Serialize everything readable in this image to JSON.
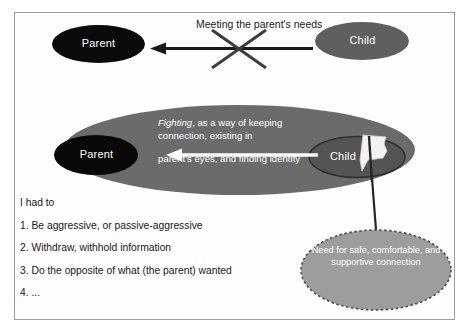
{
  "diagram": {
    "title_visible": false,
    "colors": {
      "frame_border": "#9a9a9a",
      "background": "#ffffff",
      "parent_fill": "#0a0a0a",
      "child_fill": "#5f5f5f",
      "big_ellipse_fill": "#6b6b6b",
      "inner_child_fill": "#545454",
      "dashed_ellipse_fill": "#9d9d9d",
      "dashed_ellipse_border": "#4a4a4a",
      "arrow_dark": "#1a1a1a",
      "arrow_white": "#ffffff",
      "cross_mark": "#3a3a3a",
      "flag_fill": "#f2f2f2",
      "text_dark": "#171717",
      "text_light": "#ffffff"
    },
    "top_row": {
      "parent_label": "Parent",
      "child_label": "Child",
      "arrow_label": "Meeting the parent's needs",
      "arrow_direction": "right-to-left",
      "crossed_out": true
    },
    "middle_row": {
      "parent_label": "Parent",
      "child_label": "Child",
      "arrow_direction": "right-to-left",
      "caption_italic": "Fighting",
      "caption_rest": ", as a way of keeping connection, existing in",
      "caption_second": "parent's eyes, and finding identity",
      "flag_icon": "white-flag-icon"
    },
    "need_bubble": {
      "text": "Need for safe, comfortable, and supportive connection",
      "border_style": "dashed"
    },
    "list": {
      "intro": "I had to",
      "items": [
        "1. Be aggressive, or passive-aggressive",
        "2. Withdraw, withhold information",
        "3. Do the opposite of what (the parent) wanted",
        "4. ..."
      ]
    }
  }
}
